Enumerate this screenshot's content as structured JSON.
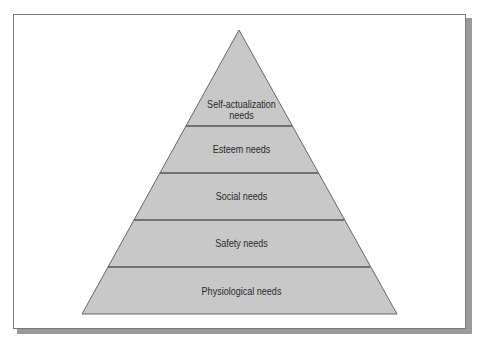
{
  "diagram": {
    "type": "pyramid",
    "title": "",
    "levels": [
      {
        "label": "Self-actualization needs",
        "line1": "Self-actualization",
        "line2": "needs"
      },
      {
        "label": "Esteem needs"
      },
      {
        "label": "Social needs"
      },
      {
        "label": "Safety needs"
      },
      {
        "label": "Physiological needs"
      }
    ],
    "colors": {
      "fill": "#c8c8c8",
      "stroke": "#555555",
      "text": "#2a2a2a",
      "frame": "#7a7a7a",
      "shadow": "#9a9a9a"
    }
  }
}
